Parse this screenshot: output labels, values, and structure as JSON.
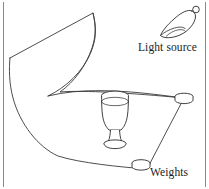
{
  "figure": {
    "background_color": "#ffffff",
    "ink_color": "#1c1c1c",
    "border_color": "#8a8a8a",
    "labels": {
      "light_source": "Light source",
      "weights": "Weights"
    },
    "objects": [
      {
        "name": "draped-cloth",
        "kind": "curved-quadrilateral-sheet"
      },
      {
        "name": "goblet",
        "kind": "stemmed-glass"
      },
      {
        "name": "weight-right",
        "kind": "cylinder-disc"
      },
      {
        "name": "weight-bottom",
        "kind": "cylinder-disc"
      },
      {
        "name": "light-source-lamp",
        "kind": "bell-shade-lamp"
      }
    ],
    "borders": {
      "left_rule": true,
      "right_rule": true,
      "top_rule": false,
      "bottom_rule": false
    }
  }
}
